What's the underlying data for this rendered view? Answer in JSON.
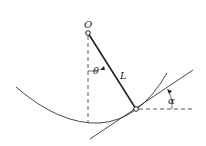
{
  "diagram": {
    "labels": {
      "pivot": "O",
      "angle_theta": "θ",
      "length": "L",
      "angle_alpha": "α"
    },
    "colors": {
      "line": "#222222",
      "background": "#ffffff"
    },
    "points": {
      "pivot": [
        88,
        33
      ],
      "bob": [
        136,
        109
      ]
    }
  }
}
